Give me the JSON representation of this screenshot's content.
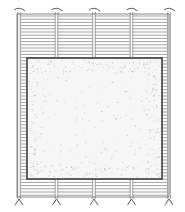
{
  "illustration": {
    "subject": "slatted bamboo mat with rectangular sheet laid on top",
    "colors": {
      "background": "#ffffff",
      "line": "#5a5a5a",
      "slat_line": "#7a7a7a",
      "sheet_fill": "#f4f4f4",
      "speckle": "#9a9a9a"
    },
    "parts": {
      "mat": "bamboo-mat",
      "sheet": "paper-sheet",
      "cords": "binding-cords",
      "ties": "cord-ties"
    },
    "cord_count": 5,
    "tie_positions": [
      "top",
      "bottom"
    ]
  }
}
